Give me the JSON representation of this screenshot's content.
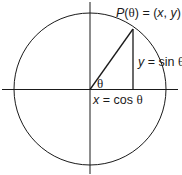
{
  "diagram": {
    "colors": {
      "stroke": "#1a1a1a",
      "background": "#ffffff"
    },
    "circle": {
      "cx": 90,
      "cy": 89,
      "r": 76
    },
    "axes": {
      "horizontal": {
        "x1": 2,
        "x2": 178,
        "y": 89
      },
      "vertical": {
        "x": 90,
        "y1": 2,
        "y2": 174
      }
    },
    "point": {
      "x": 133,
      "y": 29
    },
    "labels": {
      "point": {
        "p": "P",
        "theta": "θ",
        "eq": " = (",
        "x": "x",
        "comma": ", ",
        "y": "y",
        "close": ")"
      },
      "sin": {
        "y": "y",
        "eq": " = sin ",
        "theta": "θ"
      },
      "cos": {
        "x": "x",
        "eq": " = cos ",
        "theta": "θ"
      },
      "angle": "θ"
    }
  }
}
